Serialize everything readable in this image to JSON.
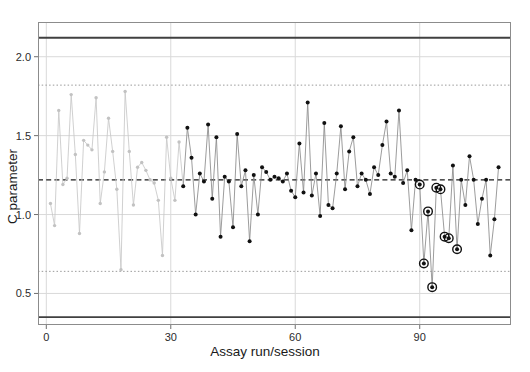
{
  "chart_data": {
    "type": "line",
    "title": "",
    "xlabel": "Assay run/session",
    "ylabel": "C parameter",
    "xlim": [
      -2,
      112
    ],
    "ylim": [
      0.3,
      2.22
    ],
    "xticks": [
      0,
      30,
      60,
      90
    ],
    "yticks": [
      0.5,
      1.0,
      1.5,
      2.0
    ],
    "ytick_labels": [
      "0.5",
      "1.0",
      "1.5",
      "2.0"
    ],
    "xtick_labels": [
      "0",
      "30",
      "60",
      "90"
    ],
    "grid": true,
    "legend": "none",
    "reference_lines": [
      {
        "name": "upper-action-limit",
        "value": 2.12,
        "style": "solid",
        "color": "#404040"
      },
      {
        "name": "upper-warning-limit",
        "value": 1.82,
        "style": "dotted",
        "color": "#9a9a9a"
      },
      {
        "name": "mean-line",
        "value": 1.22,
        "style": "dashed",
        "color": "#1a1a1a"
      },
      {
        "name": "lower-warning-limit",
        "value": 0.64,
        "style": "dotted",
        "color": "#9a9a9a"
      },
      {
        "name": "lower-action-limit",
        "value": 0.35,
        "style": "solid",
        "color": "#404040"
      }
    ],
    "series": [
      {
        "name": "C parameter",
        "x": [
          1,
          2,
          3,
          4,
          5,
          6,
          7,
          8,
          9,
          10,
          11,
          12,
          13,
          14,
          15,
          16,
          17,
          18,
          19,
          20,
          21,
          22,
          23,
          24,
          25,
          26,
          27,
          28,
          29,
          30,
          31,
          32,
          33,
          34,
          35,
          36,
          37,
          38,
          39,
          40,
          41,
          42,
          43,
          44,
          45,
          46,
          47,
          48,
          49,
          50,
          51,
          52,
          53,
          54,
          55,
          56,
          57,
          58,
          59,
          60,
          61,
          62,
          63,
          64,
          65,
          66,
          67,
          68,
          69,
          70,
          71,
          72,
          73,
          74,
          75,
          76,
          77,
          78,
          79,
          80,
          81,
          82,
          83,
          84,
          85,
          86,
          87,
          88,
          89,
          90,
          91,
          92,
          93,
          94,
          95,
          96,
          97,
          98,
          99,
          100,
          101,
          102,
          103,
          104,
          105,
          106,
          107,
          108,
          109
        ],
        "values": [
          1.07,
          0.93,
          1.66,
          1.19,
          1.23,
          1.76,
          1.38,
          0.88,
          1.47,
          1.44,
          1.41,
          1.74,
          1.07,
          1.27,
          1.61,
          1.4,
          1.16,
          0.65,
          1.78,
          1.4,
          1.06,
          1.3,
          1.33,
          1.28,
          1.22,
          1.2,
          1.09,
          0.74,
          1.49,
          1.23,
          1.09,
          1.46,
          1.18,
          1.55,
          1.36,
          1.0,
          1.26,
          1.21,
          1.57,
          1.1,
          1.49,
          0.86,
          1.24,
          1.21,
          0.92,
          1.51,
          1.18,
          1.28,
          0.83,
          1.25,
          1.0,
          1.3,
          1.27,
          1.22,
          1.24,
          1.23,
          1.21,
          1.26,
          1.15,
          1.11,
          1.45,
          1.14,
          1.71,
          1.12,
          1.26,
          0.99,
          1.58,
          1.06,
          1.04,
          1.26,
          1.56,
          1.16,
          1.4,
          1.49,
          1.18,
          1.26,
          1.22,
          1.13,
          1.3,
          1.25,
          1.44,
          1.59,
          1.26,
          1.24,
          1.66,
          1.2,
          1.28,
          0.9,
          1.22,
          1.19,
          0.69,
          1.02,
          0.54,
          1.17,
          1.16,
          0.86,
          0.85,
          1.31,
          0.78,
          1.22,
          1.06,
          1.37,
          1.22,
          0.94,
          1.1,
          1.22,
          0.74,
          0.97,
          1.3
        ],
        "shade_switch_index": 32,
        "light_color": "#c2c2c2",
        "dark_color": "#111111",
        "highlighted_indices": [
          89,
          90,
          91,
          92,
          93,
          94,
          95,
          96,
          98
        ]
      }
    ],
    "annotations": [
      {
        "name": "highlighted-run-markers",
        "description": "open circles around recent out-of-trend points"
      }
    ]
  }
}
